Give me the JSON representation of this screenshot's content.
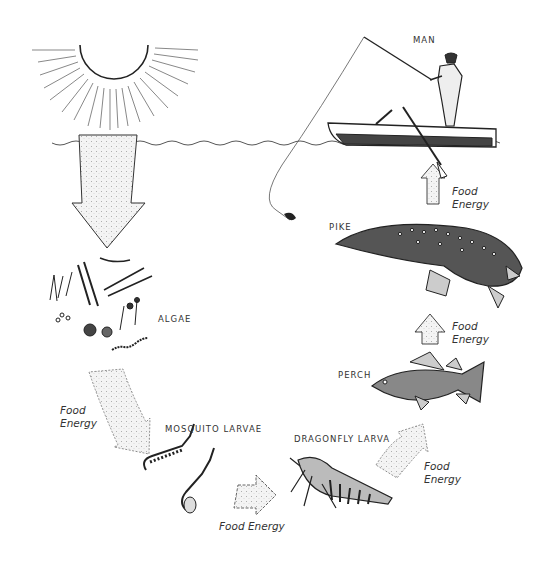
{
  "diagram": {
    "type": "food-chain",
    "organisms": [
      {
        "id": "sun",
        "label": ""
      },
      {
        "id": "algae",
        "label": "ALGAE"
      },
      {
        "id": "mosquito",
        "label": "MOSQUITO LARVAE"
      },
      {
        "id": "dragonfly",
        "label": "DRAGONFLY LARVA"
      },
      {
        "id": "perch",
        "label": "PERCH"
      },
      {
        "id": "pike",
        "label": "PIKE"
      },
      {
        "id": "man",
        "label": "MAN"
      }
    ],
    "arrows": [
      {
        "from": "sun",
        "to": "algae",
        "label": ""
      },
      {
        "from": "algae",
        "to": "mosquito",
        "line1": "Food",
        "line2": "Energy"
      },
      {
        "from": "mosquito",
        "to": "dragonfly",
        "label": "Food Energy"
      },
      {
        "from": "dragonfly",
        "to": "perch",
        "line1": "Food",
        "line2": "Energy"
      },
      {
        "from": "perch",
        "to": "pike",
        "line1": "Food",
        "line2": "Energy"
      },
      {
        "from": "pike",
        "to": "man",
        "line1": "Food",
        "line2": "Energy"
      }
    ]
  },
  "colors": {
    "ink": "#222222",
    "stipple": "#e6e6e6",
    "background": "#ffffff"
  }
}
